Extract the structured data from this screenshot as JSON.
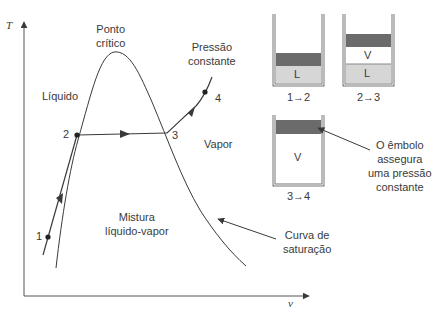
{
  "axes": {
    "y_label": "T",
    "x_label": "v"
  },
  "labels": {
    "critical_point": "Ponto\ncrítico",
    "critical_point_l1": "Ponto",
    "critical_point_l2": "crítico",
    "constant_pressure_l1": "Pressão",
    "constant_pressure_l2": "constante",
    "liquid": "Líquido",
    "vapor": "Vapor",
    "mixture_l1": "Mistura",
    "mixture_l2": "líquido-vapor",
    "saturation_curve_l1": "Curva de",
    "saturation_curve_l2": "saturação",
    "piston_note_l1": "O êmbolo",
    "piston_note_l2": "assegura",
    "piston_note_l3": "uma pressão",
    "piston_note_l4": "constante"
  },
  "points": [
    {
      "id": "1",
      "label": "1"
    },
    {
      "id": "2",
      "label": "2"
    },
    {
      "id": "3",
      "label": "3"
    },
    {
      "id": "4",
      "label": "4"
    }
  ],
  "cylinders": [
    {
      "caption": "1→2",
      "contents": [
        "L"
      ]
    },
    {
      "caption": "2→3",
      "contents": [
        "V",
        "L"
      ]
    },
    {
      "caption": "3→4",
      "contents": [
        "V"
      ]
    }
  ],
  "colors": {
    "line": "#3a3a3a",
    "piston": "#6b6b6b",
    "liquid": "#d6d6d6",
    "background": "#ffffff"
  }
}
